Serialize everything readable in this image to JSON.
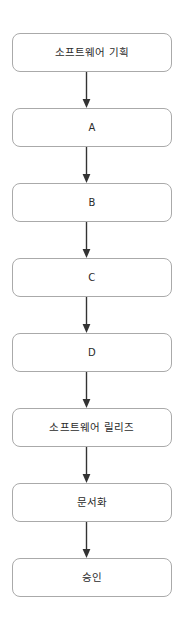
{
  "diagram": {
    "type": "vertical-flowchart",
    "background_color": "#ffffff",
    "node_border_color": "#aaaaaa",
    "node_fill_color": "#ffffff",
    "node_text_color": "#2b2b2b",
    "arrow_color": "#333333",
    "nodes": [
      {
        "id": "node-1",
        "label": "소프트웨어 기획",
        "script": "hangul",
        "x": 12,
        "y": 33,
        "width": 160,
        "height": 39
      },
      {
        "id": "node-2",
        "label": "A",
        "script": "latin",
        "x": 12,
        "y": 108,
        "width": 160,
        "height": 39
      },
      {
        "id": "node-3",
        "label": "B",
        "script": "latin",
        "x": 12,
        "y": 183,
        "width": 160,
        "height": 39
      },
      {
        "id": "node-4",
        "label": "C",
        "script": "latin",
        "x": 12,
        "y": 258,
        "width": 160,
        "height": 39
      },
      {
        "id": "node-5",
        "label": "D",
        "script": "latin",
        "x": 12,
        "y": 333,
        "width": 160,
        "height": 39
      },
      {
        "id": "node-6",
        "label": "소프트웨어 릴리즈",
        "script": "hangul",
        "x": 12,
        "y": 408,
        "width": 160,
        "height": 39
      },
      {
        "id": "node-7",
        "label": "문서화",
        "script": "hangul",
        "x": 12,
        "y": 483,
        "width": 160,
        "height": 39
      },
      {
        "id": "node-8",
        "label": "승인",
        "script": "hangul",
        "x": 12,
        "y": 558,
        "width": 160,
        "height": 39
      }
    ],
    "connectors": [
      {
        "id": "connector-1",
        "from": "node-1",
        "to": "node-2",
        "direction": "down",
        "x": 86,
        "y": 72,
        "length": 36
      },
      {
        "id": "connector-2",
        "from": "node-2",
        "to": "node-3",
        "direction": "down",
        "x": 86,
        "y": 147,
        "length": 36
      },
      {
        "id": "connector-3",
        "from": "node-3",
        "to": "node-4",
        "direction": "down",
        "x": 86,
        "y": 222,
        "length": 36
      },
      {
        "id": "connector-4",
        "from": "node-4",
        "to": "node-5",
        "direction": "down",
        "x": 86,
        "y": 297,
        "length": 36
      },
      {
        "id": "connector-5",
        "from": "node-5",
        "to": "node-6",
        "direction": "down",
        "x": 86,
        "y": 372,
        "length": 36
      },
      {
        "id": "connector-6",
        "from": "node-6",
        "to": "node-7",
        "direction": "down",
        "x": 86,
        "y": 447,
        "length": 36
      },
      {
        "id": "connector-7",
        "from": "node-7",
        "to": "node-8",
        "direction": "down",
        "x": 86,
        "y": 522,
        "length": 36
      }
    ]
  }
}
